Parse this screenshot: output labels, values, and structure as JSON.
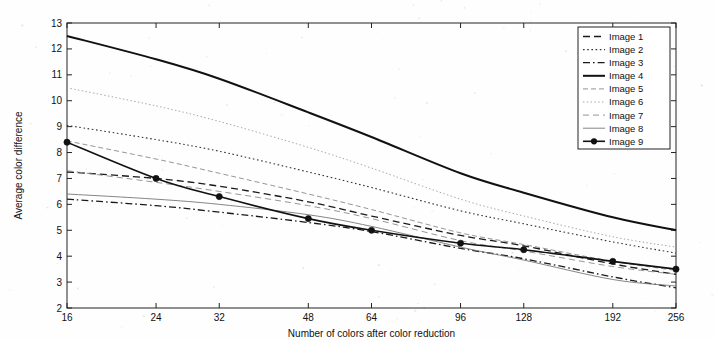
{
  "chart_data": {
    "type": "line",
    "title": "",
    "xlabel": "Number of colors after color reduction",
    "ylabel": "Average color difference",
    "x": [
      16,
      24,
      32,
      48,
      64,
      96,
      128,
      192,
      256
    ],
    "xtick_labels": [
      "16",
      "24",
      "32",
      "48",
      "64",
      "96",
      "128",
      "192",
      "256"
    ],
    "xscale": "log",
    "xlim": [
      16,
      256
    ],
    "ylim": [
      2,
      13
    ],
    "ytick_labels": [
      "2",
      "3",
      "4",
      "5",
      "6",
      "7",
      "8",
      "9",
      "10",
      "11",
      "12",
      "13"
    ],
    "yticks": [
      2,
      3,
      4,
      5,
      6,
      7,
      8,
      9,
      10,
      11,
      12,
      13
    ],
    "grid": false,
    "legend_position": "upper right",
    "series": [
      {
        "name": "Image 1",
        "style": "dashed",
        "marker": "none",
        "width": 1.3,
        "color": "#1a1a1a",
        "values": [
          7.25,
          7.0,
          6.7,
          6.1,
          5.55,
          4.8,
          4.4,
          3.7,
          3.3
        ]
      },
      {
        "name": "Image 2",
        "style": "dotted",
        "marker": "none",
        "width": 1.1,
        "color": "#333333",
        "values": [
          9.05,
          8.5,
          8.05,
          7.25,
          6.65,
          5.75,
          5.25,
          4.55,
          4.12
        ]
      },
      {
        "name": "Image 3",
        "style": "dashdot",
        "marker": "none",
        "width": 1.3,
        "color": "#1a1a1a",
        "values": [
          6.2,
          5.95,
          5.7,
          5.3,
          4.95,
          4.3,
          3.9,
          3.2,
          2.78
        ]
      },
      {
        "name": "Image 4",
        "style": "solid",
        "marker": "none",
        "width": 2.0,
        "color": "#111111",
        "values": [
          12.5,
          11.6,
          10.85,
          9.55,
          8.6,
          7.2,
          6.45,
          5.5,
          5.0
        ]
      },
      {
        "name": "Image 5",
        "style": "dashed-fine",
        "marker": "none",
        "width": 0.9,
        "color": "#8a8a8a",
        "values": [
          8.45,
          7.75,
          7.2,
          6.4,
          5.8,
          4.9,
          4.45,
          3.8,
          3.45
        ]
      },
      {
        "name": "Image 6",
        "style": "dotted-fine",
        "marker": "none",
        "width": 0.9,
        "color": "#9a9a9a",
        "values": [
          10.5,
          9.8,
          9.2,
          8.2,
          7.4,
          6.2,
          5.55,
          4.75,
          4.35
        ]
      },
      {
        "name": "Image 7",
        "style": "dashed-thin",
        "marker": "none",
        "width": 0.9,
        "color": "#8a8a8a",
        "values": [
          7.3,
          6.85,
          6.5,
          5.95,
          5.45,
          4.6,
          4.2,
          3.6,
          3.3
        ]
      },
      {
        "name": "Image 8",
        "style": "solid-thin",
        "marker": "none",
        "width": 0.9,
        "color": "#777777",
        "values": [
          6.4,
          6.2,
          6.0,
          5.6,
          5.15,
          4.35,
          3.85,
          3.1,
          2.85
        ]
      },
      {
        "name": "Image 9",
        "style": "solid",
        "marker": "circle",
        "width": 1.6,
        "color": "#111111",
        "values": [
          8.4,
          7.0,
          6.3,
          5.45,
          5.0,
          4.5,
          4.25,
          3.8,
          3.5
        ]
      }
    ]
  },
  "legend": {
    "entries": [
      "Image 1",
      "Image 2",
      "Image 3",
      "Image 4",
      "Image 5",
      "Image 6",
      "Image 7",
      "Image 8",
      "Image 9"
    ]
  },
  "axes": {
    "ylabel": "Average color difference",
    "xlabel": "Number of colors after color reduction"
  }
}
